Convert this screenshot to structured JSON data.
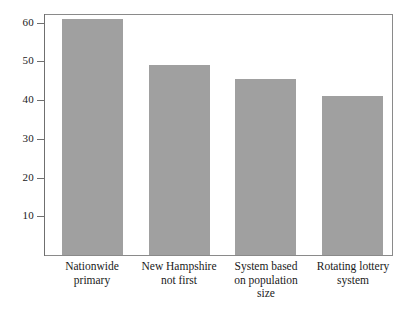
{
  "chart_data": {
    "type": "bar",
    "title": "",
    "subtitle": "",
    "xlabel": "",
    "ylabel": "",
    "categories": [
      "Nationwide primary",
      "New Hampshire not first",
      "System based on population size",
      "Rotating lottery system"
    ],
    "category_lines": [
      [
        "Nationwide",
        "primary"
      ],
      [
        "New Hampshire",
        "not first"
      ],
      [
        "System based",
        "on population",
        "size"
      ],
      [
        "Rotating lottery",
        "system"
      ]
    ],
    "values": [
      61,
      49.2,
      45.5,
      41
    ],
    "ylim": [
      0,
      62
    ],
    "yticks": [
      10,
      20,
      30,
      40,
      50,
      60
    ],
    "ytick_labels": [
      "10",
      "20",
      "30",
      "40",
      "50",
      "60"
    ],
    "grid": false,
    "legend": null,
    "legend_position": "none",
    "bar_color": "#a0a0a0",
    "frame_color": "#8a8a8a",
    "axis_color": "#6f6f6f",
    "text_color": "#1a1a1a",
    "background": "#ffffff"
  }
}
